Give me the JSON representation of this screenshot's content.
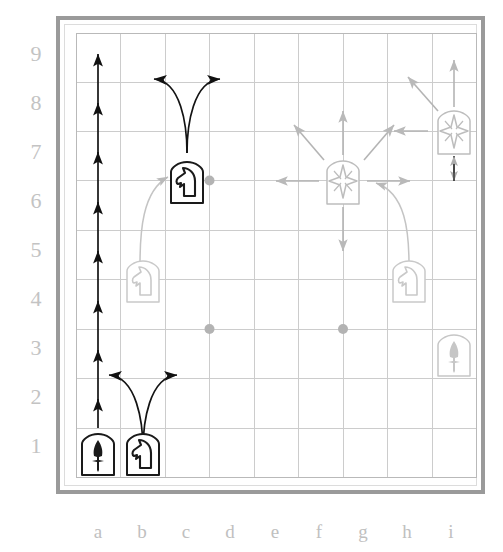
{
  "board": {
    "type": "shogi-like-9x9-move-diagram",
    "files": [
      "a",
      "b",
      "c",
      "d",
      "e",
      "f",
      "g",
      "h",
      "i"
    ],
    "ranks": [
      "9",
      "8",
      "7",
      "6",
      "5",
      "4",
      "3",
      "2",
      "1"
    ],
    "colors": {
      "frame": "#9a9a9a",
      "inner_frame": "#dcdcdc",
      "grid_line": "#c8c8c8",
      "grid_border": "#b4b4b4",
      "label": "#c3c3c3",
      "dot": "#b0b0b0",
      "piece_dark": "#1a1a1a",
      "piece_light": "#c9c9c9",
      "arrow_dark": "#111111",
      "arrow_light": "#b9b9b9",
      "background": "#ffffff"
    },
    "star_points": [
      "d7",
      "g7",
      "d4",
      "g4"
    ],
    "pieces": [
      {
        "id": "pawn-a1",
        "glyph": "pawn",
        "square": "a1",
        "file": "a",
        "rank": "1",
        "shade": "dark"
      },
      {
        "id": "knight-b1",
        "glyph": "knight",
        "square": "b1",
        "file": "b",
        "rank": "1",
        "shade": "dark"
      },
      {
        "id": "knight-c7",
        "glyph": "knight",
        "square": "c7",
        "file": "c",
        "rank": "7",
        "shade": "dark"
      },
      {
        "id": "knight-b5",
        "glyph": "knight",
        "square": "b5",
        "file": "b",
        "rank": "5",
        "shade": "light"
      },
      {
        "id": "knight-h5",
        "glyph": "knight",
        "square": "h5",
        "file": "h",
        "rank": "5",
        "shade": "light"
      },
      {
        "id": "king-g7",
        "glyph": "star",
        "square": "g7",
        "file": "g",
        "rank": "7",
        "shade": "light"
      },
      {
        "id": "king-i8",
        "glyph": "star",
        "square": "i8",
        "file": "i",
        "rank": "8",
        "shade": "light"
      },
      {
        "id": "pawn-i3",
        "glyph": "pawn",
        "square": "i3",
        "file": "i",
        "rank": "3",
        "shade": "light"
      }
    ],
    "move_markers": {
      "pawn_column_a_advances": [
        "a2",
        "a3",
        "a4",
        "a5",
        "a6",
        "a7",
        "a8",
        "a9"
      ],
      "knight_c7_jumps": [
        "b9",
        "d9"
      ],
      "knight_b1_jumps": [
        "a3",
        "c3"
      ],
      "king_g7_steps": [
        "f8",
        "g8",
        "h8",
        "f7",
        "h7",
        "f6",
        "g6",
        "h6"
      ],
      "king_i8_steps": [
        "h9",
        "i9",
        "h8",
        "i7"
      ],
      "relocation_paths": [
        {
          "from": "b5",
          "to": "c7"
        },
        {
          "from": "h5",
          "to": "g7"
        }
      ]
    }
  }
}
